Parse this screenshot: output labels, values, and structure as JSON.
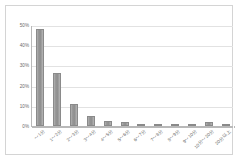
{
  "chart_data": {
    "type": "bar",
    "title": "",
    "xlabel": "",
    "ylabel": "",
    "ylim": [
      0,
      0.5
    ],
    "grid": true,
    "legend": "none",
    "ytick_labels": [
      "0%",
      "10%",
      "20%",
      "30%",
      "40%",
      "50%"
    ],
    "ytick_values": [
      0,
      0.1,
      0.2,
      0.3,
      0.4,
      0.5
    ],
    "categories": [
      "～1分",
      "1～2分",
      "2～3分",
      "3～4分",
      "4～5分",
      "5～6分",
      "6～7分",
      "7～8分",
      "8～9分",
      "9～10分",
      "10分～20分",
      "20分以上"
    ],
    "values": [
      0.48,
      0.26,
      0.11,
      0.05,
      0.025,
      0.02,
      0.01,
      0.008,
      0.004,
      0.004,
      0.022,
      0.005
    ],
    "value_labels": [
      "48%",
      "26%",
      "11%",
      "5%",
      "2.5%",
      "2%",
      "1%",
      "0.8%",
      "0.4%",
      "0.4%",
      "2.2%",
      "0.5%"
    ],
    "bar_color": "#9a9a9a",
    "grid_color": "#e2e2e2",
    "axis_color": "#b9b9b9",
    "text_color": "#6a6a6a"
  }
}
